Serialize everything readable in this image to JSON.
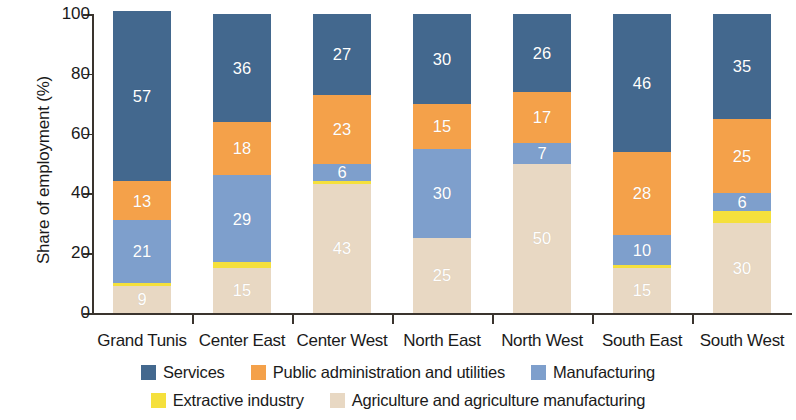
{
  "chart_data": {
    "type": "bar",
    "subtype": "stacked-bar-100",
    "title": "",
    "xlabel": "",
    "ylabel": "Share of employment (%)",
    "ylim": [
      0,
      100
    ],
    "yticks": [
      0,
      20,
      40,
      60,
      80,
      100
    ],
    "ytick_labels": [
      "0",
      "20",
      "40",
      "60",
      "80",
      "100"
    ],
    "grid": false,
    "legend_position": "bottom",
    "categories": [
      "Grand Tunis",
      "Center East",
      "Center West",
      "North East",
      "North West",
      "South East",
      "South West"
    ],
    "series": [
      {
        "name": "Services",
        "color": "#43688e",
        "values": [
          57,
          36,
          27,
          30,
          26,
          46,
          35
        ],
        "labels": [
          "57",
          "36",
          "27",
          "30",
          "26",
          "46",
          "35"
        ]
      },
      {
        "name": "Public administration and utilities",
        "color": "#f4a14a",
        "values": [
          13,
          18,
          23,
          15,
          17,
          28,
          25
        ],
        "labels": [
          "13",
          "18",
          "23",
          "15",
          "17",
          "28",
          "25"
        ]
      },
      {
        "name": "Manufacturing",
        "color": "#7e9fcc",
        "values": [
          21,
          29,
          6,
          30,
          7,
          10,
          6
        ],
        "labels": [
          "21",
          "29",
          "6",
          "30",
          "7",
          "10",
          "6"
        ]
      },
      {
        "name": "Extractive industry",
        "color": "#f5e03c",
        "values": [
          1,
          2,
          1,
          0,
          0,
          1,
          4
        ],
        "labels": [
          "",
          "",
          "",
          "",
          "",
          "",
          ""
        ]
      },
      {
        "name": "Agriculture and agriculture manufacturing",
        "color": "#e8d8c3",
        "values": [
          9,
          15,
          43,
          25,
          50,
          15,
          30
        ],
        "labels": [
          "9",
          "15",
          "43",
          "25",
          "50",
          "15",
          "30"
        ]
      }
    ],
    "stack_order_bottom_to_top": [
      "Agriculture and agriculture manufacturing",
      "Extractive industry",
      "Manufacturing",
      "Public administration and utilities",
      "Services"
    ]
  },
  "legend": {
    "rows": [
      [
        {
          "label": "Services",
          "color": "#43688e"
        },
        {
          "label": "Public administration and utilities",
          "color": "#f4a14a"
        },
        {
          "label": "Manufacturing",
          "color": "#7e9fcc"
        }
      ],
      [
        {
          "label": "Extractive industry",
          "color": "#f5e03c"
        },
        {
          "label": "Agriculture and agriculture manufacturing",
          "color": "#e8d8c3"
        }
      ]
    ]
  }
}
